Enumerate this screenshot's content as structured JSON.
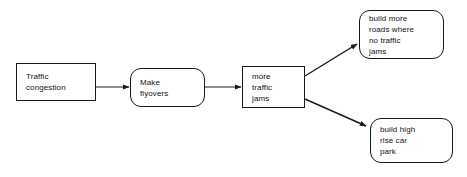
{
  "diagram": {
    "background_color": "#ffffff",
    "stroke_color": "#1a1a1a",
    "text_color": "#111111",
    "nodes": [
      {
        "id": "traffic-congestion",
        "label": "Traffic\ncongestion",
        "shape": "rectangle",
        "align": "left"
      },
      {
        "id": "make-flyovers",
        "label": "Make\nflyovers",
        "shape": "rounded-rectangle",
        "align": "left"
      },
      {
        "id": "more-traffic-jams",
        "label": "more\ntraffic\njams",
        "shape": "rectangle",
        "align": "left"
      },
      {
        "id": "build-more-roads",
        "label": "build more\nroads where\nno traffic\njams",
        "shape": "rounded-rectangle",
        "align": "left"
      },
      {
        "id": "build-car-park",
        "label": "build high\nrise car\npark",
        "shape": "rounded-rectangle",
        "align": "left"
      }
    ],
    "edges": [
      {
        "id": "edge-congestion-to-flyovers",
        "from": "traffic-congestion",
        "to": "make-flyovers",
        "style": "arrow"
      },
      {
        "id": "edge-flyovers-to-jams",
        "from": "make-flyovers",
        "to": "more-traffic-jams",
        "style": "arrow"
      },
      {
        "id": "edge-jams-to-roads",
        "from": "more-traffic-jams",
        "to": "build-more-roads",
        "style": "arrow"
      },
      {
        "id": "edge-jams-to-carpark",
        "from": "more-traffic-jams",
        "to": "build-car-park",
        "style": "arrow"
      }
    ]
  }
}
